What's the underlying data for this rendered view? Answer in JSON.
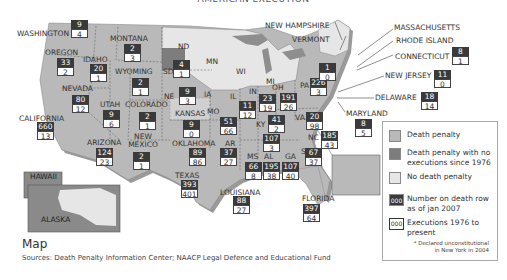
{
  "top_title": "AMERICAN EXECUTION",
  "colors": {
    "death_penalty": "#b9b9b9",
    "no_executions": "#7d7d7d",
    "no_death_penalty": "#e6e6e6",
    "death_row_box": "#3a3a3a",
    "executions_box": "#ffffff"
  },
  "callout_labels": {
    "new_hampshire": "NEW HAMPSHIRE",
    "vermont": "VERMONT",
    "massachusetts": "MASSACHUSETTS",
    "rhode_island": "RHODE ISLAND",
    "connecticut": "CONNECTICUT",
    "new_jersey": "NEW JERSEY",
    "delaware": "DELAWARE",
    "maryland": "MARYLAND"
  },
  "inset_labels": {
    "hawaii": "HAWAII",
    "alaska": "ALASKA"
  },
  "no_dp_states": {
    "nd": "ND",
    "mn": "MN",
    "wi": "WI",
    "mi": "MI",
    "ia": "IA",
    "il_wv_note": ""
  },
  "states": [
    {
      "name": "WASHINGTON",
      "death_row": "9",
      "executions": "4"
    },
    {
      "name": "OREGON",
      "death_row": "33",
      "executions": "2"
    },
    {
      "name": "IDAHO",
      "death_row": "20",
      "executions": "1"
    },
    {
      "name": "MONTANA",
      "death_row": "2",
      "executions": "3"
    },
    {
      "name": "WYOMING",
      "death_row": "2",
      "executions": "1"
    },
    {
      "name": "NEVADA",
      "death_row": "80",
      "executions": "12"
    },
    {
      "name": "UTAH",
      "death_row": "9",
      "executions": "6"
    },
    {
      "name": "COLORADO",
      "death_row": "2",
      "executions": "1"
    },
    {
      "name": "CALIFORNIA",
      "death_row": "660",
      "executions": "13"
    },
    {
      "name": "ARIZONA",
      "death_row": "124",
      "executions": "23"
    },
    {
      "name": "NEW MEXICO",
      "death_row": "2",
      "executions": "1"
    },
    {
      "name": "SD",
      "death_row": "4",
      "executions": "1"
    },
    {
      "name": "NE",
      "death_row": "9",
      "executions": "3"
    },
    {
      "name": "KANSAS",
      "death_row": "9",
      "executions": "0"
    },
    {
      "name": "OKLAHOMA",
      "death_row": "89",
      "executions": "86"
    },
    {
      "name": "TEXAS",
      "death_row": "393",
      "executions": "401"
    },
    {
      "name": "MO",
      "death_row": "51",
      "executions": "66"
    },
    {
      "name": "AR",
      "death_row": "37",
      "executions": "27"
    },
    {
      "name": "LOUISIANA",
      "death_row": "88",
      "executions": "27"
    },
    {
      "name": "IL",
      "death_row": "11",
      "executions": "12"
    },
    {
      "name": "IN",
      "death_row": "23",
      "executions": "19"
    },
    {
      "name": "OH",
      "death_row": "191",
      "executions": "26"
    },
    {
      "name": "KY",
      "death_row": "41",
      "executions": "2"
    },
    {
      "name": "TN",
      "death_row": "107",
      "executions": "3"
    },
    {
      "name": "MS",
      "death_row": "66",
      "executions": "8"
    },
    {
      "name": "AL",
      "death_row": "195",
      "executions": "38"
    },
    {
      "name": "GA",
      "death_row": "107",
      "executions": "40"
    },
    {
      "name": "SC",
      "death_row": "67",
      "executions": "37"
    },
    {
      "name": "NC",
      "death_row": "185",
      "executions": "43"
    },
    {
      "name": "VA",
      "death_row": "20",
      "executions": "98"
    },
    {
      "name": "PA",
      "death_row": "226",
      "executions": "3"
    },
    {
      "name": "NY",
      "death_row": "1",
      "executions": "0"
    },
    {
      "name": "FLORIDA",
      "death_row": "397",
      "executions": "64"
    },
    {
      "name": "CONNECTICUT",
      "death_row": "8",
      "executions": "1"
    },
    {
      "name": "NEW JERSEY",
      "death_row": "11",
      "executions": "0"
    },
    {
      "name": "DELAWARE",
      "death_row": "18",
      "executions": "14"
    },
    {
      "name": "MARYLAND",
      "death_row": "8",
      "executions": "5"
    }
  ],
  "legend": {
    "death_penalty": "Death penalty",
    "no_executions": "Death penalty with no executions since 1976",
    "no_death_penalty": "No death penalty",
    "death_row_swatch": "000",
    "death_row_label": "Number on death row as of jan 2007",
    "executions_swatch": "000",
    "executions_label": "Executions 1976 to present",
    "note": "* Declared unconstitutional in New York in 2004"
  },
  "footer": {
    "heading": "Map",
    "sources": "Sources: Death Penalty Information Center; NAACP Legal Defence and Educational Fund"
  }
}
